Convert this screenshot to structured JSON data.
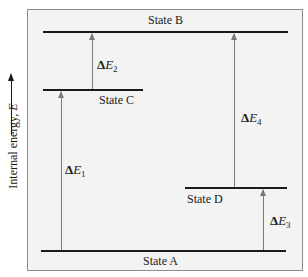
{
  "diagram": {
    "type": "energy-level-diagram",
    "y_axis": {
      "label_prefix": "Internal energy, ",
      "label_var": "E"
    },
    "states": [
      {
        "id": "A",
        "label": "State A",
        "relative_energy": "lowest"
      },
      {
        "id": "D",
        "label": "State D",
        "relative_energy": "low"
      },
      {
        "id": "C",
        "label": "State C",
        "relative_energy": "high"
      },
      {
        "id": "B",
        "label": "State B",
        "relative_energy": "highest"
      }
    ],
    "transitions": [
      {
        "id": "E1",
        "delta": "Δ",
        "var": "E",
        "sub": "1",
        "from": "State A",
        "to": "State C"
      },
      {
        "id": "E2",
        "delta": "Δ",
        "var": "E",
        "sub": "2",
        "from": "State C",
        "to": "State B"
      },
      {
        "id": "E3",
        "delta": "Δ",
        "var": "E",
        "sub": "3",
        "from": "State A",
        "to": "State D"
      },
      {
        "id": "E4",
        "delta": "Δ",
        "var": "E",
        "sub": "4",
        "from": "State D",
        "to": "State B"
      }
    ],
    "colors": {
      "background": "#f3f3f3",
      "border": "#8d8d8d",
      "level_line": "#1a1a1a",
      "arrow": "#7a7a7a"
    }
  }
}
